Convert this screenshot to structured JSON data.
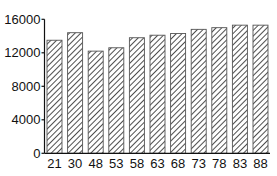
{
  "chart_data": {
    "type": "bar",
    "title": "",
    "xlabel": "",
    "ylabel": "",
    "categories": [
      "21",
      "30",
      "48",
      "53",
      "58",
      "63",
      "68",
      "73",
      "78",
      "83",
      "88"
    ],
    "values": [
      13500,
      14400,
      12200,
      12600,
      13800,
      14100,
      14300,
      14800,
      15000,
      15300,
      15300
    ],
    "ylim": [
      0,
      16000
    ],
    "yticks": [
      0,
      4000,
      8000,
      12000,
      16000
    ],
    "ytick_labels": [
      "0",
      "4000",
      "8000",
      "12000",
      "16000"
    ],
    "grid": false,
    "legend": null,
    "bar_style": "diagonal-hatch",
    "colors": {
      "bar_fill": "#ffffff",
      "hatch": "#222222",
      "axis": "#111111"
    }
  }
}
